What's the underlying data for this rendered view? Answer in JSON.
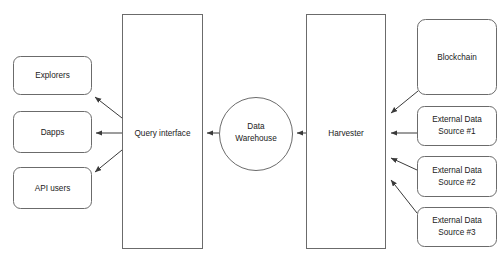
{
  "diagram": {
    "background_color": "#ffffff",
    "shape_stroke_color": "#6b6b6b",
    "shape_fill_color": "#ffffff",
    "connector_color": "#3a3a3a",
    "text_color": "#1a1a1a",
    "consumers": [
      {
        "id": "explorers",
        "label": "Explorers",
        "x": 13,
        "y": 56,
        "w": 78,
        "h": 38
      },
      {
        "id": "dapps",
        "label": "Dapps",
        "x": 13,
        "y": 111,
        "w": 78,
        "h": 41
      },
      {
        "id": "api-users",
        "label": "API users",
        "x": 13,
        "y": 167,
        "w": 78,
        "h": 41
      }
    ],
    "pillars": [
      {
        "id": "query-interface",
        "label": "Query interface",
        "x": 122,
        "y": 14,
        "w": 80,
        "h": 234
      },
      {
        "id": "harvester",
        "label": "Harvester",
        "x": 306,
        "y": 14,
        "w": 79,
        "h": 234
      }
    ],
    "store": {
      "id": "data-warehouse",
      "label_line1": "Data",
      "label_line2": "Warehouse",
      "cx": 256,
      "cy": 134,
      "r": 37
    },
    "sources": [
      {
        "id": "blockchain",
        "label_line1": "Blockchain",
        "label_line2": "",
        "x": 417,
        "y": 19,
        "w": 79,
        "h": 75
      },
      {
        "id": "external-data-source-1",
        "label_line1": "External Data",
        "label_line2": "Source #1",
        "x": 417,
        "y": 106,
        "w": 79,
        "h": 39
      },
      {
        "id": "external-data-source-2",
        "label_line1": "External Data",
        "label_line2": "Source #2",
        "x": 417,
        "y": 156,
        "w": 79,
        "h": 40
      },
      {
        "id": "external-data-source-3",
        "label_line1": "External Data",
        "label_line2": "Source #3",
        "x": 417,
        "y": 207,
        "w": 79,
        "h": 39
      }
    ],
    "connectors": [
      {
        "id": "query-to-explorers",
        "from": "query-interface",
        "to": "explorers",
        "direction": "left"
      },
      {
        "id": "query-to-dapps",
        "from": "query-interface",
        "to": "dapps",
        "direction": "left"
      },
      {
        "id": "query-to-api-users",
        "from": "query-interface",
        "to": "api-users",
        "direction": "left"
      },
      {
        "id": "warehouse-to-query",
        "from": "data-warehouse",
        "to": "query-interface",
        "direction": "left"
      },
      {
        "id": "harvester-to-warehouse",
        "from": "harvester",
        "to": "data-warehouse",
        "direction": "left"
      },
      {
        "id": "blockchain-to-harvester",
        "from": "blockchain",
        "to": "harvester",
        "direction": "left"
      },
      {
        "id": "source1-to-harvester",
        "from": "external-data-source-1",
        "to": "harvester",
        "direction": "left"
      },
      {
        "id": "source2-to-harvester",
        "from": "external-data-source-2",
        "to": "harvester",
        "direction": "left"
      },
      {
        "id": "source3-to-harvester",
        "from": "external-data-source-3",
        "to": "harvester",
        "direction": "left"
      }
    ]
  }
}
